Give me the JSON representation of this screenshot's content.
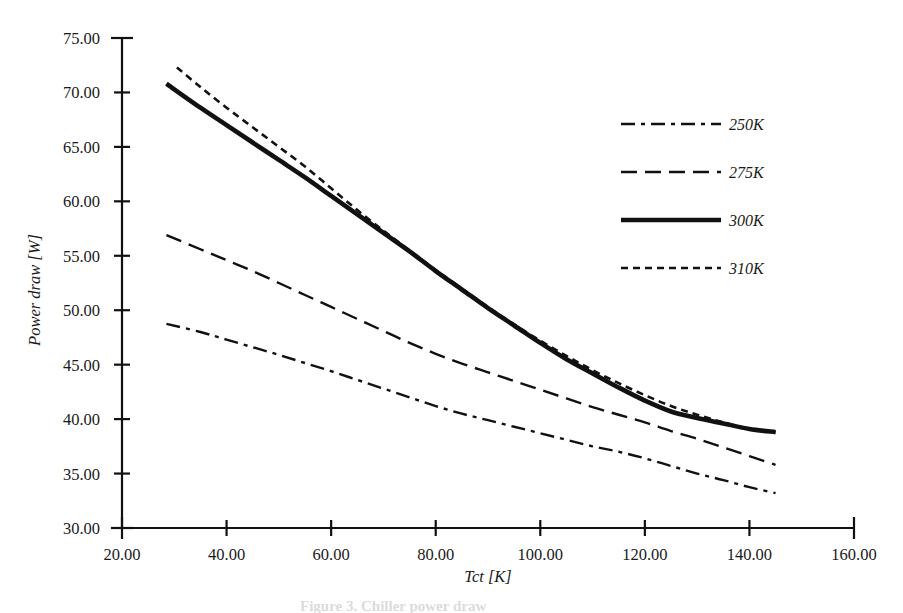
{
  "figure": {
    "caption_partial": "Figure 3. Chiller power draw",
    "background": "#ffffff",
    "ink_color": "#111111"
  },
  "chart_data": {
    "type": "line",
    "title": "",
    "xlabel": "Tct [K]",
    "ylabel": "Power draw [W]",
    "xlim": [
      20.0,
      160.0
    ],
    "ylim": [
      30.0,
      75.0
    ],
    "xticks": [
      "20.00",
      "40.00",
      "60.00",
      "80.00",
      "100.00",
      "120.00",
      "140.00",
      "160.00"
    ],
    "xtick_values": [
      20,
      40,
      60,
      80,
      100,
      120,
      140,
      160
    ],
    "yticks": [
      "30.00",
      "35.00",
      "40.00",
      "45.00",
      "50.00",
      "55.00",
      "60.00",
      "65.00",
      "70.00",
      "75.00"
    ],
    "ytick_values": [
      30,
      35,
      40,
      45,
      50,
      55,
      60,
      65,
      70,
      75
    ],
    "grid": false,
    "legend_position": "upper-right",
    "series": [
      {
        "name": "250K",
        "label": "250K",
        "style": "dashdot",
        "dasharray": "14,6,4,6",
        "width": 2.4,
        "color": "#111111",
        "x": [
          28.5,
          35,
          40,
          45,
          50,
          55,
          60,
          65,
          70,
          75,
          80,
          85,
          90,
          95,
          100,
          105,
          110,
          115,
          120,
          125,
          130,
          135,
          140,
          145
        ],
        "y": [
          48.75,
          48.0,
          47.3,
          46.6,
          45.9,
          45.15,
          44.4,
          43.6,
          42.8,
          42.0,
          41.2,
          40.5,
          39.9,
          39.3,
          38.7,
          38.1,
          37.5,
          37.0,
          36.4,
          35.7,
          35.0,
          34.4,
          33.75,
          33.2
        ]
      },
      {
        "name": "275K",
        "label": "275K",
        "style": "dashed",
        "dasharray": "16,8",
        "width": 2.4,
        "color": "#111111",
        "x": [
          28.5,
          35,
          40,
          45,
          50,
          55,
          60,
          65,
          70,
          75,
          80,
          85,
          90,
          95,
          100,
          105,
          110,
          115,
          120,
          125,
          130,
          135,
          140,
          145
        ],
        "y": [
          56.9,
          55.6,
          54.6,
          53.6,
          52.5,
          51.4,
          50.3,
          49.2,
          48.1,
          47.0,
          46.0,
          45.1,
          44.3,
          43.5,
          42.7,
          41.9,
          41.1,
          40.4,
          39.7,
          38.9,
          38.2,
          37.4,
          36.6,
          35.8
        ]
      },
      {
        "name": "300K",
        "label": "300K",
        "style": "solid",
        "dasharray": "none",
        "width": 4.6,
        "color": "#111111",
        "x": [
          28.5,
          35,
          40,
          45,
          50,
          55,
          60,
          65,
          70,
          75,
          80,
          85,
          90,
          95,
          100,
          105,
          110,
          115,
          120,
          125,
          130,
          135,
          140,
          145
        ],
        "y": [
          70.8,
          68.6,
          67.0,
          65.4,
          63.8,
          62.2,
          60.5,
          58.8,
          57.1,
          55.4,
          53.6,
          51.9,
          50.2,
          48.6,
          47.0,
          45.5,
          44.2,
          42.9,
          41.7,
          40.7,
          40.1,
          39.6,
          39.1,
          38.8
        ]
      },
      {
        "name": "310K",
        "label": "310K",
        "style": "dotted",
        "dasharray": "7,5",
        "width": 2.6,
        "color": "#111111",
        "x": [
          30.5,
          35,
          40,
          45,
          50,
          55,
          60,
          65,
          70,
          75,
          80,
          85,
          90,
          95,
          100,
          105,
          110,
          115,
          120,
          125,
          130,
          135,
          140,
          145
        ],
        "y": [
          72.3,
          70.5,
          68.6,
          66.8,
          65.0,
          63.2,
          61.2,
          59.2,
          57.3,
          55.5,
          53.7,
          52.0,
          50.3,
          48.7,
          47.2,
          45.8,
          44.5,
          43.3,
          42.2,
          41.2,
          40.4,
          39.7,
          39.1,
          38.8
        ]
      }
    ]
  },
  "legend": {
    "items": [
      {
        "label": "250K",
        "style": "dashdot"
      },
      {
        "label": "275K",
        "style": "dashed"
      },
      {
        "label": "300K",
        "style": "solid"
      },
      {
        "label": "310K",
        "style": "dotted"
      }
    ]
  }
}
